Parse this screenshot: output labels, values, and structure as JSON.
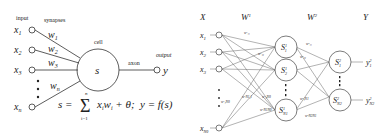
{
  "perceptron": {
    "label_input": "input",
    "label_synapses": "synapses",
    "label_cell": "cell",
    "label_axon": "axon",
    "label_output": "output",
    "inputs": [
      "x1",
      "x2",
      "x3",
      "xn"
    ],
    "weights": [
      "w1",
      "w2",
      "w3",
      "wn"
    ],
    "cell_symbol": "s",
    "output_symbol": "y",
    "formula_s": "s = Σ xᵢwᵢ + θ;",
    "formula_sum_top": "n",
    "formula_sum_bottom": "i=1",
    "formula_y": "y = f(s)"
  },
  "network": {
    "col_x": "X",
    "col_w1": "W¹",
    "col_w2": "W²",
    "col_y": "Y",
    "inputs": [
      "x₁",
      "x₂",
      "x₃",
      "x_N₀"
    ],
    "layer1": [
      "S₁¹",
      "S₂¹",
      "S¹_N₁"
    ],
    "layer2": [
      "S₁²",
      "S²_N₂"
    ],
    "outputs": [
      "y₁²",
      "y²_N₂"
    ]
  },
  "colors": {
    "stroke": "#333333",
    "line": "#555555",
    "background": "#ffffff"
  }
}
